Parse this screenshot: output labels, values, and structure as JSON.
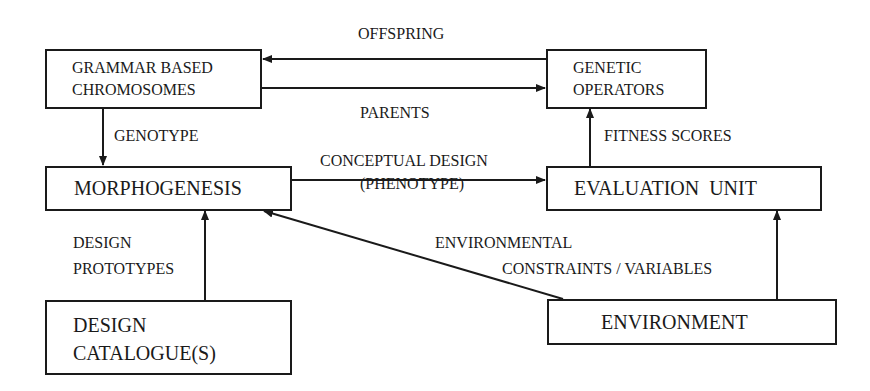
{
  "diagram": {
    "nodes": {
      "chromosomes": {
        "line1": "GRAMMAR BASED",
        "line2": "CHROMOSOMES"
      },
      "genetic_operators": {
        "line1": "GENETIC",
        "line2": "OPERATORS"
      },
      "morphogenesis": {
        "label": "MORPHOGENESIS"
      },
      "evaluation_unit": {
        "label": "EVALUATION  UNIT"
      },
      "design_catalogue": {
        "line1": "DESIGN",
        "line2": "CATALOGUE(S)"
      },
      "environment": {
        "label": "ENVIRONMENT"
      }
    },
    "edges": {
      "offspring": {
        "label": "OFFSPRING",
        "from": "genetic_operators",
        "to": "chromosomes"
      },
      "parents": {
        "label": "PARENTS",
        "from": "chromosomes",
        "to": "genetic_operators"
      },
      "genotype": {
        "label": "GENOTYPE",
        "from": "chromosomes",
        "to": "morphogenesis"
      },
      "conceptual_design": {
        "line1": "CONCEPTUAL DESIGN",
        "line2": "(PHENOTYPE)",
        "from": "morphogenesis",
        "to": "evaluation_unit"
      },
      "fitness_scores": {
        "label": "FITNESS SCORES",
        "from": "evaluation_unit",
        "to": "genetic_operators"
      },
      "design_prototypes": {
        "line1": "DESIGN",
        "line2": "PROTOTYPES",
        "from": "design_catalogue",
        "to": "morphogenesis"
      },
      "environmental_constraints": {
        "line1": "ENVIRONMENTAL",
        "line2": "CONSTRAINTS / VARIABLES",
        "from": "environment",
        "to": "morphogenesis"
      },
      "environment_to_evaluation": {
        "from": "environment",
        "to": "evaluation_unit"
      }
    },
    "colors": {
      "ink": "#1a1a1a",
      "background": "#ffffff"
    }
  }
}
